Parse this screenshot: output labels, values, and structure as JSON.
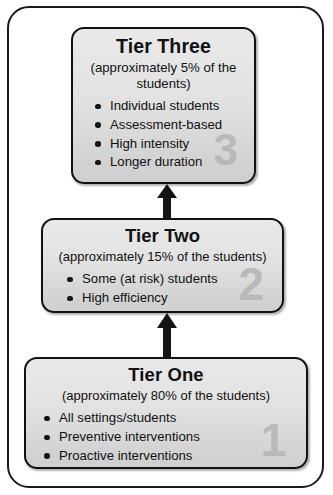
{
  "diagram": {
    "frame_border_color": "#1a1a1a",
    "box_fill_top": "#e9e9e9",
    "box_fill_bottom": "#cfcfcf",
    "box_border_color": "#111111",
    "watermark_color": "#b9b9b9",
    "arrow_color": "#141414",
    "tiers": [
      {
        "id": "tier-three",
        "title": "Tier Three",
        "subtitle": "(approximately 5% of the students)",
        "watermark": "3",
        "bullets": [
          "Individual students",
          "Assessment-based",
          "High intensity",
          "Longer duration"
        ]
      },
      {
        "id": "tier-two",
        "title": "Tier Two",
        "subtitle": "(approximately 15% of the students)",
        "watermark": "2",
        "bullets": [
          "Some (at risk) students",
          "High efficiency"
        ]
      },
      {
        "id": "tier-one",
        "title": "Tier One",
        "subtitle": "(approximately 80% of the students)",
        "watermark": "1",
        "bullets": [
          "All settings/students",
          "Preventive interventions",
          "Proactive interventions"
        ]
      }
    ],
    "arrows": [
      {
        "id": "arrow-tier-two-to-tier-three",
        "direction": "up"
      },
      {
        "id": "arrow-tier-one-to-tier-two",
        "direction": "up"
      }
    ]
  }
}
